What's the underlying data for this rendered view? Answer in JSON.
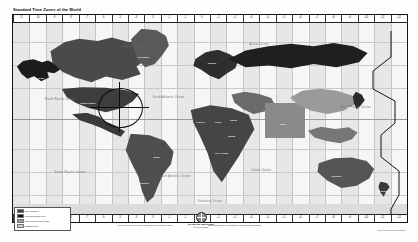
{
  "document": {
    "title": "Standard Time Zones of the World",
    "type": "world-time-zone-map",
    "projection_note": "Mercator-style rectangular world map, grayscale"
  },
  "top_ruler": {
    "labels": [
      "-11",
      "-10",
      "-9",
      "-8",
      "-7",
      "-6",
      "-5",
      "-4",
      "-3",
      "-2",
      "-1",
      "0",
      "+1",
      "+2",
      "+3",
      "+4",
      "+5",
      "+6",
      "+7",
      "+8",
      "+9",
      "+10",
      "+11",
      "+12"
    ]
  },
  "bottom_ruler": {
    "labels": [
      "-11",
      "-10",
      "-9",
      "-8",
      "-7",
      "-6",
      "-5",
      "-4",
      "-3",
      "-2",
      "-1",
      "0",
      "+1",
      "+2",
      "+3",
      "+4",
      "+5",
      "+6",
      "+7",
      "+8",
      "+9",
      "+10",
      "+11",
      "+12"
    ]
  },
  "legend": {
    "title": "Legend",
    "entries": [
      {
        "label": "Zone boundary",
        "color": "#3a3a3a"
      },
      {
        "label": "International Date Line",
        "color": "#101010"
      },
      {
        "label": "Zone using half-hour offset",
        "color": "#9e9e9e"
      },
      {
        "label": "Standard zone",
        "color": "#cfcfcf"
      }
    ]
  },
  "publisher": {
    "name": "STANDARD TIME ZONES",
    "subtitle": "OF THE WORLD",
    "icon": "globe-icon"
  },
  "notes": {
    "left": "Time zones are referenced to Coordinated Universal Time (UTC).",
    "right": "Some areas observe non-standard or seasonal daylight offsets.",
    "credit": "Scale 1:80,000,000 at the Equator"
  },
  "annotation": {
    "type": "circle-marker",
    "target": "Eastern United States",
    "color": "#0c0c0c"
  },
  "ocean_labels": [
    {
      "text": "Arctic Ocean",
      "x": 30.5,
      "y": 12
    },
    {
      "text": "Arctic Ocean",
      "x": 62.5,
      "y": 11
    },
    {
      "text": "North Atlantic Ocean",
      "x": 39.5,
      "y": 39
    },
    {
      "text": "North Pacific Ocean",
      "x": 12.0,
      "y": 40
    },
    {
      "text": "North Pacific Ocean",
      "x": 87.0,
      "y": 44
    },
    {
      "text": "South Pacific Ocean",
      "x": 14.5,
      "y": 78
    },
    {
      "text": "South Atlantic Ocean",
      "x": 41.0,
      "y": 80
    },
    {
      "text": "Indian Ocean",
      "x": 63.0,
      "y": 77
    },
    {
      "text": "Southern Ocean",
      "x": 50.0,
      "y": 93
    }
  ],
  "region_labels": [
    {
      "text": "Alaska",
      "x": 7.0,
      "y": 29
    },
    {
      "text": "Canada",
      "x": 22.0,
      "y": 30
    },
    {
      "text": "Greenland",
      "x": 33.0,
      "y": 18
    },
    {
      "text": "Iceland",
      "x": 42.5,
      "y": 23
    },
    {
      "text": "United States",
      "x": 19.0,
      "y": 42
    },
    {
      "text": "Mexico",
      "x": 19.0,
      "y": 53
    },
    {
      "text": "Brazil",
      "x": 36.5,
      "y": 70
    },
    {
      "text": "Argentina",
      "x": 33.0,
      "y": 84
    },
    {
      "text": "Norway",
      "x": 50.5,
      "y": 21
    },
    {
      "text": "Russia",
      "x": 70.0,
      "y": 25
    },
    {
      "text": "China",
      "x": 76.0,
      "y": 47
    },
    {
      "text": "India",
      "x": 68.5,
      "y": 53
    },
    {
      "text": "Japan",
      "x": 85.5,
      "y": 44
    },
    {
      "text": "Algeria",
      "x": 47.5,
      "y": 52
    },
    {
      "text": "Libya",
      "x": 52.0,
      "y": 52
    },
    {
      "text": "Egypt",
      "x": 56.0,
      "y": 51
    },
    {
      "text": "Sudan",
      "x": 55.5,
      "y": 59
    },
    {
      "text": "D.R. Congo",
      "x": 53.0,
      "y": 68
    },
    {
      "text": "South Africa",
      "x": 54.0,
      "y": 83
    },
    {
      "text": "Indonesia",
      "x": 78.0,
      "y": 68
    },
    {
      "text": "Australia",
      "x": 82.0,
      "y": 80
    },
    {
      "text": "New Zealand",
      "x": 93.0,
      "y": 88
    }
  ],
  "map_style": {
    "land_color": "#6f6f6f",
    "ocean_color": "#fbfbfb",
    "grid_color": "#c4c4c4",
    "frame_color": "#111111"
  }
}
